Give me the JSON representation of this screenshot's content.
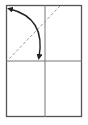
{
  "diagram": {
    "type": "fold-instruction",
    "colors": {
      "background": "#ffffff",
      "outline": "#555555",
      "crease": "#777777",
      "dashed_fold": "#9a9a9a",
      "arrow": "#222222"
    },
    "paper": {
      "x": 6,
      "y": 5,
      "width": 76,
      "height": 112
    },
    "creases": [
      {
        "name": "vertical-center",
        "x1": 45,
        "y1": 5,
        "x2": 45,
        "y2": 117
      },
      {
        "name": "horizontal-center",
        "x1": 6,
        "y1": 61,
        "x2": 82,
        "y2": 61
      }
    ],
    "fold_line": {
      "style": "dashed",
      "x1": 60,
      "y1": 6,
      "x2": 8,
      "y2": 60
    },
    "arrow": {
      "direction": "fold corner down to center",
      "start": {
        "x": 10,
        "y": 9
      },
      "control": {
        "x": 46,
        "y": 18
      },
      "end": {
        "x": 39,
        "y": 57
      }
    }
  }
}
